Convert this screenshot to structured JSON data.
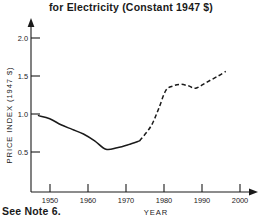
{
  "chart_data": {
    "type": "line",
    "title": "for Electricity (Constant 1947 $)",
    "xlabel": "YEAR",
    "ylabel": "PRICE INDEX (1947 $)",
    "xlim": [
      1945,
      2004
    ],
    "ylim": [
      0.0,
      2.2
    ],
    "xticks": [
      1950,
      1960,
      1970,
      1980,
      1990,
      2000
    ],
    "xtick_labels": [
      "1950",
      "1960",
      "1970",
      "1980",
      "1990",
      "2000"
    ],
    "yticks": [
      0.5,
      1.0,
      1.5,
      2.0
    ],
    "ytick_labels": [
      "0.5",
      "1.0",
      "1.5",
      "2.0"
    ],
    "grid": false,
    "legend": "none",
    "series": [
      {
        "name": "Historical price index (solid)",
        "style": "solid",
        "x": [
          1947,
          1950,
          1953,
          1956,
          1959,
          1962,
          1965,
          1968,
          1971,
          1974
        ],
        "values": [
          1.0,
          0.96,
          0.88,
          0.82,
          0.76,
          0.67,
          0.56,
          0.58,
          0.62,
          0.67
        ]
      },
      {
        "name": "Projected price index (dashed)",
        "style": "dashed",
        "x": [
          1974,
          1977,
          1979,
          1981,
          1983,
          1985,
          1987,
          1989,
          1992,
          1995,
          1997
        ],
        "values": [
          0.67,
          0.86,
          1.08,
          1.33,
          1.39,
          1.41,
          1.39,
          1.36,
          1.44,
          1.52,
          1.58
        ]
      }
    ],
    "annotations": [
      "See Note 6."
    ]
  },
  "footer": {
    "note": "See Note 6."
  }
}
